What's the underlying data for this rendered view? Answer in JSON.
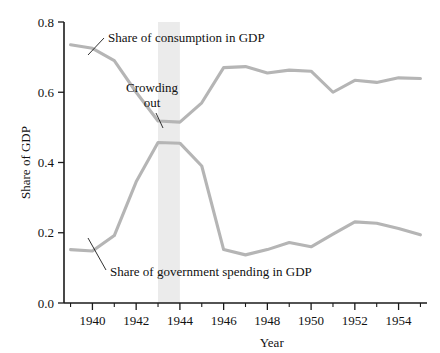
{
  "chart_data": {
    "type": "line",
    "title": "",
    "xlabel": "Year",
    "ylabel": "Share of GDP",
    "xlim": [
      1938.7,
      1955.3
    ],
    "ylim": [
      0.0,
      0.8
    ],
    "grid": false,
    "legend_position": "inline-annotations",
    "x": [
      1939,
      1940,
      1941,
      1942,
      1943,
      1944,
      1945,
      1946,
      1947,
      1948,
      1949,
      1950,
      1951,
      1952,
      1953,
      1954,
      1955
    ],
    "xticks_major": [
      1940,
      1942,
      1944,
      1946,
      1948,
      1950,
      1952,
      1954
    ],
    "xticks_minor": [
      1939,
      1941,
      1943,
      1945,
      1947,
      1949,
      1951,
      1953,
      1955
    ],
    "xtick_labels": [
      "1940",
      "1942",
      "1944",
      "1946",
      "1948",
      "1950",
      "1952",
      "1954"
    ],
    "yticks": [
      0.0,
      0.2,
      0.4,
      0.6,
      0.8
    ],
    "ytick_labels": [
      "0.0",
      "0.2",
      "0.4",
      "0.6",
      "0.8"
    ],
    "series": [
      {
        "name": "Share of consumption in GDP",
        "color": "#b5b5b5",
        "values": [
          0.735,
          0.725,
          0.69,
          0.6,
          0.518,
          0.515,
          0.57,
          0.67,
          0.673,
          0.655,
          0.663,
          0.66,
          0.6,
          0.634,
          0.628,
          0.641,
          0.639
        ]
      },
      {
        "name": "Share of government spending in GDP",
        "color": "#b5b5b5",
        "values": [
          0.152,
          0.148,
          0.192,
          0.345,
          0.457,
          0.455,
          0.39,
          0.152,
          0.137,
          0.152,
          0.172,
          0.16,
          0.196,
          0.231,
          0.227,
          0.212,
          0.194
        ]
      }
    ],
    "shaded_band": {
      "label": "Crowding out",
      "x_start": 1943,
      "x_end": 1944,
      "color": "#ebebeb"
    },
    "annotations": [
      {
        "text": "Share of consumption in GDP",
        "target_x": 1940.6,
        "target_y": 0.678
      },
      {
        "text": "Crowding out",
        "target_x": 1943.5,
        "target_y": 0.5
      },
      {
        "text": "Share of government spending in GDP",
        "target_x": 1941.0,
        "target_y": 0.192
      }
    ]
  },
  "annotation_text": {
    "consumption": "Share of consumption in GDP",
    "crowding_line1": "Crowding",
    "crowding_line2": "out",
    "government": "Share of government spending in GDP"
  }
}
